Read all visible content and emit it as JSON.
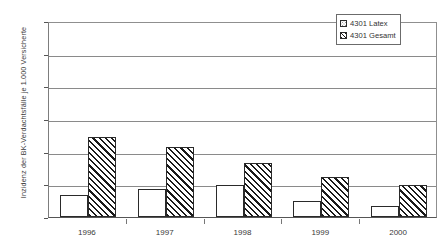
{
  "chart_data": {
    "type": "bar",
    "title": "",
    "subtitle": "",
    "xlabel": "",
    "ylabel": "Inzidenz der BK-Verdachtsfälle je 1.000 Versicherte",
    "categories": [
      "1996",
      "1997",
      "1998",
      "1999",
      "2000"
    ],
    "series": [
      {
        "name": "4301 Latex",
        "pattern": "dotted",
        "values": [
          0.068,
          0.085,
          0.098,
          0.048,
          0.033
        ]
      },
      {
        "name": "4301 Gesamt",
        "pattern": "diagonal-hatch",
        "values": [
          0.245,
          0.213,
          0.165,
          0.122,
          0.097
        ]
      }
    ],
    "ylim": [
      0,
      0.6
    ],
    "ytick_labels": [
      "0",
      "0,1",
      "0,2",
      "0,3",
      "0,4",
      "0,5",
      "0,6"
    ],
    "ytick_values": [
      0,
      0.1,
      0.2,
      0.3,
      0.4,
      0.5,
      0.6
    ],
    "grid": true,
    "grid_axis": "y",
    "legend_position": "top-right",
    "colors": {
      "gridline": "#8a8a8a",
      "axis": "#555555",
      "bar_outline": "#2a2a2a",
      "hatch": "#1a1a1a",
      "dots": "#9a9a9a",
      "text": "#333333",
      "background": "#ffffff"
    }
  },
  "legend": {
    "items": [
      {
        "label": "4301 Latex"
      },
      {
        "label": "4301 Gesamt"
      }
    ]
  },
  "axes": {
    "y_title": "Inzidenz der BK-Verdachtsfälle je 1.000 Versicherte",
    "y_labels": [
      "0,6",
      "0,5",
      "0,4",
      "0,3",
      "0,2",
      "0,1",
      "0"
    ],
    "x_labels": [
      "1996",
      "1997",
      "1998",
      "1999",
      "2000"
    ]
  }
}
